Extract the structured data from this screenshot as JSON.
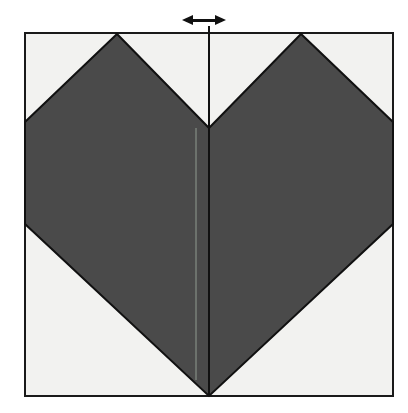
{
  "figure": {
    "title": "Origami heart fold diagram",
    "caption": "",
    "background_color": "#ffffff",
    "paper": {
      "label": "square-paper-sheet",
      "fill_color": "#f2f2f0",
      "border_color": "#1a1a1a",
      "border_width": 2,
      "x": 25,
      "y": 33,
      "width": 368,
      "height": 363
    },
    "heart": {
      "label": "heart-shape",
      "fill_color": "#4a4a4a",
      "outline_color": "#111111",
      "outline_width": 2,
      "points": "117,34 25,122 25,224 209,396 393,224 393,122 301,34 209,128"
    },
    "center_fold_line": {
      "label": "vertical-center-fold-line",
      "color": "#111111",
      "width": 2,
      "x": 209,
      "y_top": 26,
      "y_bottom": 396
    },
    "secondary_crease_line": {
      "label": "faint-crease-line",
      "color": "#8f9a8f",
      "width": 1,
      "x": 196,
      "y_top": 128,
      "y_bottom": 380
    },
    "arrow": {
      "label": "double-headed-horizontal-arrow",
      "icon": "left-right-arrow-icon",
      "color": "#111111",
      "center_x": 204,
      "center_y": 20,
      "half_length": 22,
      "head_length": 11,
      "head_half_height": 5,
      "shaft_half_height": 1
    }
  }
}
